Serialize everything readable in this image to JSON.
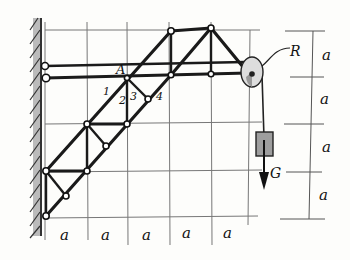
{
  "diagram": {
    "labels": {
      "node_A": "A",
      "pulley": "R",
      "weight": "G",
      "member_1": "1",
      "member_2": "2",
      "member_3": "3",
      "member_4": "4"
    },
    "horizontal_dimensions": [
      "a",
      "a",
      "a",
      "a",
      "a"
    ],
    "vertical_dimensions": [
      "a",
      "a",
      "a",
      "a"
    ],
    "colors": {
      "members": "#1a1a1a",
      "grid": "#777777",
      "wall_hatch": "#555555",
      "pulley_fill": "#bdbdbd",
      "weight_fill": "#9e9e9e"
    }
  }
}
